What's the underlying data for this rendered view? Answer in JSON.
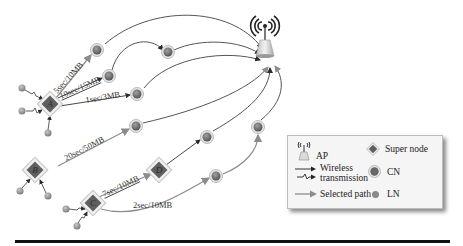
{
  "diagram": {
    "type": "network-topology",
    "access_point": {
      "label": "AP",
      "icon": "wifi-antenna-icon"
    },
    "super_nodes": [
      {
        "id": "A",
        "letter": "A"
      },
      {
        "id": "B",
        "letter": "B"
      },
      {
        "id": "C",
        "letter": "C"
      },
      {
        "id": "D",
        "letter": "D"
      }
    ],
    "edge_labels": [
      {
        "from": "A",
        "text": "5sec/10MB"
      },
      {
        "from": "A",
        "text": "10sec/15MB"
      },
      {
        "from": "A",
        "text": "1sec/3MB"
      },
      {
        "from": "B",
        "text": "20sec/50MB"
      },
      {
        "from": "C",
        "to": "D",
        "text": "7sec/10MB"
      },
      {
        "from": "C",
        "text": "2sec/10MB"
      }
    ]
  },
  "legend": {
    "items": [
      {
        "icon": "ap-icon",
        "label": "AP"
      },
      {
        "icon": "super-node-icon",
        "label": "Super node"
      },
      {
        "icon": "wireless-transmission-icon",
        "label_line1": "Wireless",
        "label_line2": "transmission"
      },
      {
        "icon": "cn-icon",
        "label": "CN"
      },
      {
        "icon": "selected-path-icon",
        "label": "Selected path"
      },
      {
        "icon": "ln-icon",
        "label": "LN"
      }
    ]
  },
  "colors": {
    "node_fill": "#6e6e6e",
    "node_ring": "#d8d8d8",
    "diamond_fill": "#5f5f5f",
    "diamond_frame": "#cfcfcf",
    "path_gray": "#8c8c8c",
    "arrow_dark": "#2b2b2b",
    "rule": "#111111"
  }
}
